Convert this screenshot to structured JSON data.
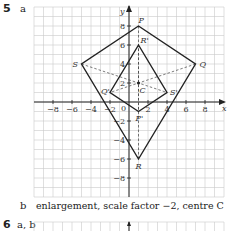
{
  "question5": {
    "number": "5",
    "part_a": "a",
    "part_b_label": "b",
    "part_b_text": "enlargement, scale factor −2, centre C"
  },
  "question6": {
    "number": "6",
    "parts": "a, b"
  },
  "chart_data": {
    "type": "diagram",
    "title": "",
    "xlabel": "x",
    "ylabel": "y",
    "xlim": [
      -10,
      10
    ],
    "ylim": [
      -10,
      10
    ],
    "grid": true,
    "x_ticks": [
      -8,
      -6,
      -4,
      -2,
      0,
      2,
      4,
      6,
      8
    ],
    "y_ticks": [
      -8,
      -6,
      -4,
      -2,
      2,
      4,
      6,
      8
    ],
    "shapes": [
      {
        "name": "PQRS",
        "points": {
          "P": [
            1,
            8
          ],
          "Q": [
            7,
            4
          ],
          "R": [
            1,
            -6
          ],
          "S": [
            -5,
            4
          ]
        }
      },
      {
        "name": "P'Q'R'S'",
        "points": {
          "R'": [
            1,
            6
          ],
          "S'": [
            4,
            1
          ],
          "P'": [
            1,
            -1
          ],
          "Q'": [
            -2,
            1
          ]
        }
      }
    ],
    "centre": {
      "label": "C",
      "point": [
        1,
        2
      ]
    },
    "construction_lines": "dashed lines joining corresponding vertices through C"
  }
}
